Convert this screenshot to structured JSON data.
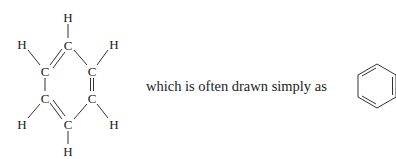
{
  "figure": {
    "caption": "which is often drawn simply as",
    "colors": {
      "ink": "#222222",
      "bond": "#333333",
      "background": "#ffffff"
    },
    "kekule_structure": {
      "atoms": [
        {
          "id": "H1",
          "symbol": "H",
          "x": 68,
          "y": 17
        },
        {
          "id": "C1",
          "symbol": "C",
          "x": 68,
          "y": 45
        },
        {
          "id": "H2",
          "symbol": "H",
          "x": 22,
          "y": 44
        },
        {
          "id": "C2",
          "symbol": "C",
          "x": 45,
          "y": 71
        },
        {
          "id": "H3",
          "symbol": "H",
          "x": 114,
          "y": 44
        },
        {
          "id": "C3",
          "symbol": "C",
          "x": 92,
          "y": 71
        },
        {
          "id": "C4",
          "symbol": "C",
          "x": 45,
          "y": 98
        },
        {
          "id": "H4",
          "symbol": "H",
          "x": 22,
          "y": 124
        },
        {
          "id": "C5",
          "symbol": "C",
          "x": 92,
          "y": 98
        },
        {
          "id": "H5",
          "symbol": "H",
          "x": 114,
          "y": 124
        },
        {
          "id": "C6",
          "symbol": "C",
          "x": 68,
          "y": 124
        },
        {
          "id": "H6",
          "symbol": "H",
          "x": 68,
          "y": 151
        }
      ],
      "bonds": [
        {
          "from": "C1",
          "to": "H1",
          "order": 1
        },
        {
          "from": "C1",
          "to": "C2",
          "order": 2
        },
        {
          "from": "C1",
          "to": "C3",
          "order": 1
        },
        {
          "from": "C2",
          "to": "H2",
          "order": 1
        },
        {
          "from": "C3",
          "to": "H3",
          "order": 1
        },
        {
          "from": "C2",
          "to": "C4",
          "order": 1
        },
        {
          "from": "C3",
          "to": "C5",
          "order": 2
        },
        {
          "from": "C4",
          "to": "H4",
          "order": 1
        },
        {
          "from": "C5",
          "to": "H5",
          "order": 1
        },
        {
          "from": "C4",
          "to": "C6",
          "order": 2
        },
        {
          "from": "C5",
          "to": "C6",
          "order": 1
        },
        {
          "from": "C6",
          "to": "H6",
          "order": 1
        }
      ]
    },
    "skeletal_structure": {
      "shape": "hexagon",
      "double_bond_edges": [
        "upper-left",
        "right",
        "lower-left"
      ]
    }
  }
}
